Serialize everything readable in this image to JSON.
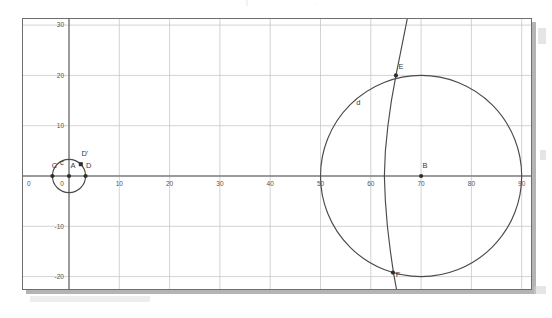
{
  "figure": {
    "kind": "geometry-plot",
    "background_color": "#ffffff",
    "frame_color": "#6e6e6e",
    "grid_color": "#c8c8c8",
    "axis_color": "#808080",
    "object_color": "#4a4a4a",
    "label_color": "#3a3a3a"
  },
  "ghost_artifacts": {
    "top_left": "",
    "top_mid": "|",
    "top_right": "."
  },
  "chart_data": {
    "type": "scatter",
    "title": "",
    "xlabel": "",
    "ylabel": "",
    "xlim": [
      -1.5,
      92
    ],
    "ylim": [
      -23,
      32
    ],
    "grid": true,
    "grid_step_x": 10,
    "grid_step_y": 10,
    "legend": "none",
    "x_ticks": [
      0,
      10,
      20,
      30,
      40,
      50,
      60,
      70,
      80,
      90
    ],
    "x_tick_labels": [
      "0",
      "10",
      "20",
      "30",
      "40",
      "50",
      "60",
      "70",
      "80",
      "90"
    ],
    "y_ticks": [
      -20,
      -10,
      0,
      10,
      20,
      30
    ],
    "y_tick_labels": [
      "-20",
      "-10",
      "0",
      "10",
      "20",
      "30"
    ],
    "origin_label": "0",
    "circles": [
      {
        "name": "c",
        "label": "c",
        "center_label": "A",
        "cx": 0,
        "cy": 0,
        "r": 3.3,
        "label_x": -1.4,
        "label_y": 2.2
      },
      {
        "name": "d",
        "label": "d",
        "center_label": "B",
        "cx": 70,
        "cy": 0,
        "r": 20,
        "label_x": 57.5,
        "label_y": 14.2
      }
    ],
    "curve": {
      "name": "arc-through-E-F",
      "points": [
        [
          67.4,
          32.0
        ],
        [
          66.6,
          28.0
        ],
        [
          65.8,
          24.0
        ],
        [
          65.0,
          20.0
        ],
        [
          64.1,
          15.0
        ],
        [
          63.4,
          10.0
        ],
        [
          62.9,
          5.0
        ],
        [
          62.7,
          0.0
        ],
        [
          62.9,
          -5.0
        ],
        [
          63.3,
          -10.0
        ],
        [
          63.9,
          -15.0
        ],
        [
          64.5,
          -19.2
        ],
        [
          65.2,
          -23.0
        ]
      ]
    },
    "points": [
      {
        "label": "A",
        "x": 0,
        "y": 0,
        "marker": "dot",
        "label_dx": 4,
        "label_dy": 9
      },
      {
        "label": "C",
        "x": -3.3,
        "y": 0,
        "marker": "dot",
        "label_dx": 2,
        "label_dy": 9
      },
      {
        "label": "D",
        "x": 3.3,
        "y": 0,
        "marker": "dot",
        "label_dx": 3,
        "label_dy": 9
      },
      {
        "label": "D'",
        "x": 2.35,
        "y": 2.35,
        "marker": "square",
        "label_dx": 4,
        "label_dy": 9
      },
      {
        "label": "B",
        "x": 70,
        "y": 0,
        "marker": "dot",
        "label_dx": 4,
        "label_dy": 9
      },
      {
        "label": "E",
        "x": 65,
        "y": 20,
        "marker": "dot",
        "label_dx": 5,
        "label_dy": 7
      },
      {
        "label": "F",
        "x": 64.4,
        "y": -19.2,
        "marker": "dot",
        "label_dx": 5,
        "label_dy": -3
      }
    ]
  }
}
